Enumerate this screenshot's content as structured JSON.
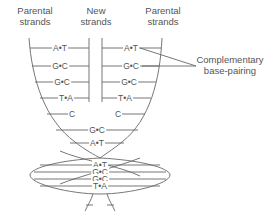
{
  "labels": {
    "parental_left": [
      "Parental",
      "strands"
    ],
    "new": [
      "New",
      "strands"
    ],
    "parental_right": [
      "Parental",
      "strands"
    ],
    "callout": [
      "Complementary",
      "base-pairing"
    ]
  },
  "upper_pairs": {
    "left": [
      "A•T",
      "G•C",
      "G•C",
      "T•A",
      "C"
    ],
    "right": [
      "A•T",
      "G•C",
      "G•C",
      "T•A",
      "C"
    ]
  },
  "center_pairs": [
    "G•C",
    "A•T"
  ],
  "helix_pairs": [
    "A•T",
    "G•C",
    "G•C",
    "T•A"
  ],
  "colors": {
    "line": "#666666",
    "text": "#555555"
  }
}
